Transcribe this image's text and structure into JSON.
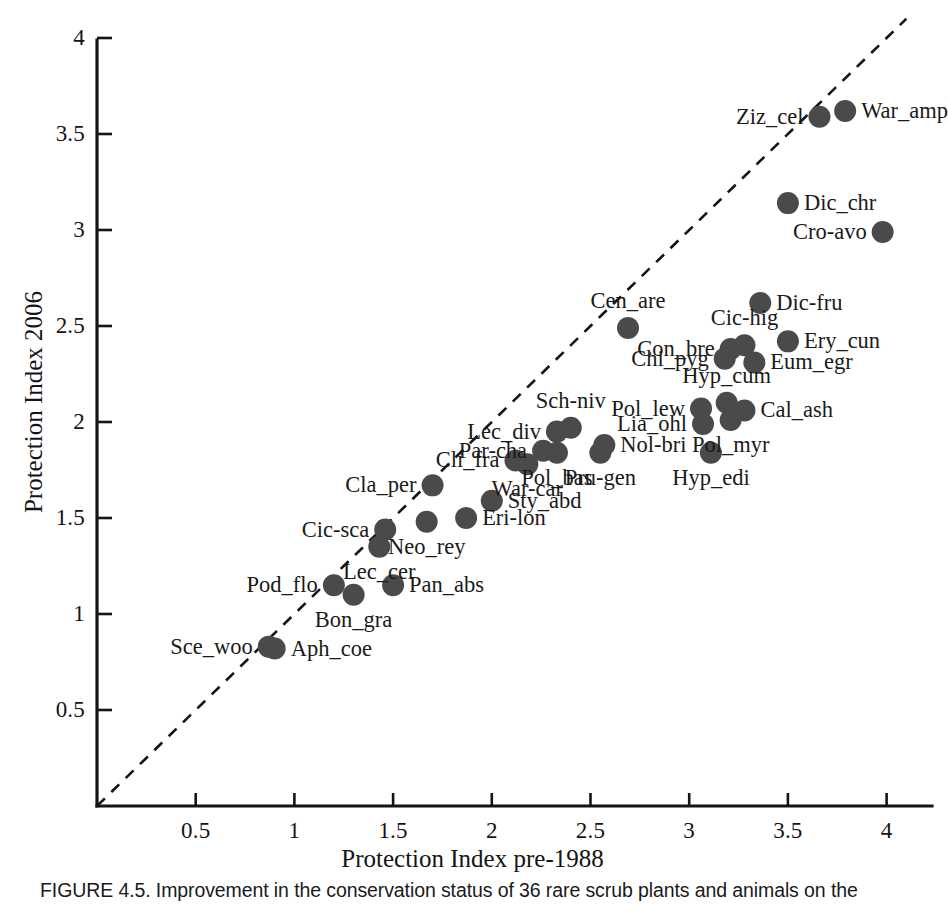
{
  "figure": {
    "caption": "FIGURE 4.5. Improvement in the conservation status of 36 rare scrub plants and animals on the"
  },
  "chart_data": {
    "type": "scatter",
    "title": "",
    "xlabel": "Protection Index pre-1988",
    "ylabel": "Protection Index 2006",
    "xlim": [
      0,
      4.15
    ],
    "ylim": [
      0,
      4.1
    ],
    "grid": false,
    "legend": "none",
    "xticks": [
      "0.5",
      "1",
      "1.5",
      "2",
      "2.5",
      "3",
      "3.5",
      "4"
    ],
    "xtick_values": [
      0.5,
      1,
      1.5,
      2,
      2.5,
      3,
      3.5,
      4
    ],
    "yticks": [
      "0.5",
      "1",
      "1.5",
      "2",
      "2.5",
      "3",
      "3.5",
      "4"
    ],
    "ytick_values": [
      0.5,
      1,
      1.5,
      2,
      2.5,
      3,
      3.5,
      4
    ],
    "annotations": [
      {
        "text": "identity line y = x (dashed, 1:1 reference)"
      }
    ],
    "reference_line": {
      "style": "dashed",
      "from": [
        0,
        0
      ],
      "to": [
        4.1,
        4.1
      ]
    },
    "marker": {
      "shape": "circle",
      "color": "#4a4a4a",
      "radius_px": 11
    },
    "n_points": 36,
    "points": [
      {
        "label": "Sce_woo",
        "x": 0.87,
        "y": 0.83,
        "pos": "left"
      },
      {
        "label": "Aph_coe",
        "x": 0.9,
        "y": 0.82,
        "pos": "right"
      },
      {
        "label": "Pod_flo",
        "x": 1.2,
        "y": 1.15,
        "pos": "left"
      },
      {
        "label": "Bon_gra",
        "x": 1.3,
        "y": 1.1,
        "pos": "below"
      },
      {
        "label": "Pan_abs",
        "x": 1.5,
        "y": 1.15,
        "pos": "right"
      },
      {
        "label": "Lec_cer",
        "x": 1.43,
        "y": 1.35,
        "pos": "below"
      },
      {
        "label": "Cic-sca",
        "x": 1.46,
        "y": 1.44,
        "pos": "left"
      },
      {
        "label": "Neo_rey",
        "x": 1.67,
        "y": 1.48,
        "pos": "below"
      },
      {
        "label": "Cla_per",
        "x": 1.7,
        "y": 1.67,
        "pos": "left"
      },
      {
        "label": "Eri-lon",
        "x": 1.87,
        "y": 1.5,
        "pos": "right"
      },
      {
        "label": "Sty_abd",
        "x": 2.0,
        "y": 1.59,
        "pos": "right"
      },
      {
        "label": "Cli_fra",
        "x": 2.12,
        "y": 1.8,
        "pos": "left"
      },
      {
        "label": "War-car",
        "x": 2.18,
        "y": 1.78,
        "pos": "below"
      },
      {
        "label": "Par-cha",
        "x": 2.26,
        "y": 1.85,
        "pos": "left"
      },
      {
        "label": "Pol_bas",
        "x": 2.33,
        "y": 1.84,
        "pos": "below"
      },
      {
        "label": "Lec_div",
        "x": 2.33,
        "y": 1.95,
        "pos": "left"
      },
      {
        "label": "Sch-niv",
        "x": 2.4,
        "y": 1.97,
        "pos": "above"
      },
      {
        "label": "Pru-gen",
        "x": 2.55,
        "y": 1.84,
        "pos": "below"
      },
      {
        "label": "Nol-bri",
        "x": 2.57,
        "y": 1.88,
        "pos": "right"
      },
      {
        "label": "Cen_are",
        "x": 2.69,
        "y": 2.49,
        "pos": "above"
      },
      {
        "label": "Pol_lew",
        "x": 3.06,
        "y": 2.07,
        "pos": "left"
      },
      {
        "label": "Lia_ohl",
        "x": 3.07,
        "y": 1.99,
        "pos": "left"
      },
      {
        "label": "Hyp_edi",
        "x": 3.11,
        "y": 1.84,
        "pos": "below"
      },
      {
        "label": "Hyp_cum",
        "x": 3.19,
        "y": 2.1,
        "pos": "above"
      },
      {
        "label": "Cal_ash",
        "x": 3.28,
        "y": 2.06,
        "pos": "right"
      },
      {
        "label": "Pol_myr",
        "x": 3.21,
        "y": 2.01,
        "pos": "below"
      },
      {
        "label": "Con_bre",
        "x": 3.21,
        "y": 2.38,
        "pos": "left"
      },
      {
        "label": "Chi_pyg",
        "x": 3.18,
        "y": 2.33,
        "pos": "left"
      },
      {
        "label": "Cic-hig",
        "x": 3.28,
        "y": 2.4,
        "pos": "above"
      },
      {
        "label": "Eum_egr",
        "x": 3.33,
        "y": 2.31,
        "pos": "right"
      },
      {
        "label": "Dic-fru",
        "x": 3.36,
        "y": 2.62,
        "pos": "right"
      },
      {
        "label": "Ery_cun",
        "x": 3.5,
        "y": 2.42,
        "pos": "right"
      },
      {
        "label": "Dic_chr",
        "x": 3.5,
        "y": 3.14,
        "pos": "right"
      },
      {
        "label": "Ziz_cel",
        "x": 3.66,
        "y": 3.59,
        "pos": "left"
      },
      {
        "label": "War_amp",
        "x": 3.79,
        "y": 3.62,
        "pos": "right"
      },
      {
        "label": "Cro-avo",
        "x": 3.98,
        "y": 2.99,
        "pos": "left"
      }
    ]
  }
}
